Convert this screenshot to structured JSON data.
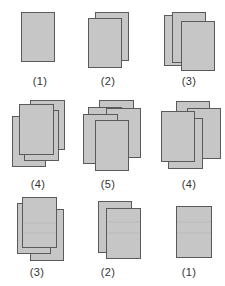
{
  "colors": {
    "page_fill": "#c6c6c6",
    "page_stroke": "#5a5a5a",
    "label_text": "#333333",
    "background": "#ffffff"
  },
  "figures": [
    {
      "name": "stack-1-top",
      "label": "(1)",
      "label_x": 40,
      "label_y": 75,
      "pages": [
        [
          21,
          12,
          33,
          49
        ]
      ]
    },
    {
      "name": "stack-2-top",
      "label": "(2)",
      "label_x": 108,
      "label_y": 75,
      "pages": [
        [
          95,
          12,
          33,
          48
        ],
        [
          88,
          18,
          33,
          49
        ]
      ]
    },
    {
      "name": "stack-3-top",
      "label": "(3)",
      "label_x": 189,
      "label_y": 75,
      "pages": [
        [
          164,
          15,
          33,
          50
        ],
        [
          172,
          12,
          33,
          50
        ],
        [
          181,
          21,
          33,
          49
        ]
      ]
    },
    {
      "name": "stack-4-middle-left",
      "label": "(4)",
      "label_x": 38,
      "label_y": 178,
      "pages": [
        [
          30,
          100,
          34,
          49
        ],
        [
          12,
          116,
          33,
          50
        ],
        [
          24,
          110,
          34,
          50
        ],
        [
          19,
          104,
          34,
          50
        ]
      ]
    },
    {
      "name": "stack-5-middle",
      "label": "(5)",
      "label_x": 108,
      "label_y": 178,
      "pages": [
        [
          99,
          100,
          34,
          50
        ],
        [
          88,
          107,
          33,
          50
        ],
        [
          106,
          108,
          34,
          49
        ],
        [
          83,
          114,
          34,
          49
        ],
        [
          95,
          120,
          33,
          50
        ]
      ]
    },
    {
      "name": "stack-4-middle-right",
      "label": "(4)",
      "label_x": 189,
      "label_y": 178,
      "pages": [
        [
          176,
          101,
          33,
          50
        ],
        [
          187,
          108,
          33,
          50
        ],
        [
          168,
          118,
          34,
          50
        ],
        [
          161,
          111,
          33,
          50
        ]
      ]
    },
    {
      "name": "stack-3-bottom",
      "label": "(3)",
      "label_x": 37,
      "label_y": 266,
      "pages": [
        [
          30,
          209,
          33,
          51
        ],
        [
          17,
          203,
          33,
          50
        ],
        [
          22,
          197,
          34,
          50
        ]
      ],
      "rules": [
        223,
        233
      ]
    },
    {
      "name": "stack-2-bottom",
      "label": "(2)",
      "label_x": 108,
      "label_y": 266,
      "pages": [
        [
          98,
          201,
          33,
          51
        ],
        [
          106,
          208,
          34,
          50
        ]
      ],
      "rules": [
        222,
        233
      ]
    },
    {
      "name": "stack-1-bottom",
      "label": "(1)",
      "label_x": 189,
      "label_y": 266,
      "pages": [
        [
          176,
          206,
          35,
          51
        ]
      ],
      "rules": [
        222,
        233
      ]
    }
  ]
}
